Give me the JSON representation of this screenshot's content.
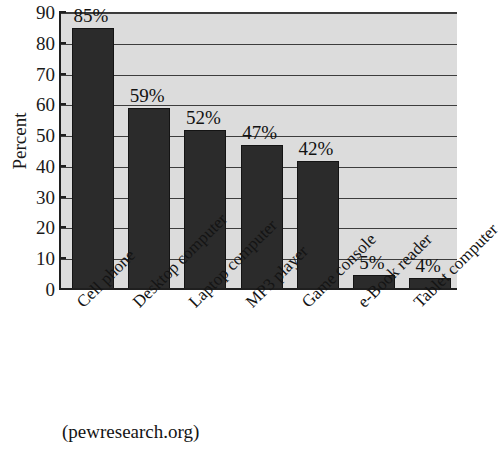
{
  "chart_data": {
    "type": "bar",
    "title": "",
    "xlabel": "",
    "ylabel": "Percent",
    "ylim": [
      0,
      90
    ],
    "ytick_step": 10,
    "yticks": [
      0,
      10,
      20,
      30,
      40,
      50,
      60,
      70,
      80,
      90
    ],
    "ytick_labels": [
      "0",
      "10",
      "20",
      "30",
      "40",
      "50",
      "60",
      "70",
      "80",
      "90"
    ],
    "grid": true,
    "grid_axis": "y",
    "legend": false,
    "legend_position": "none",
    "categories": [
      "Cell phone",
      "Desktop computer",
      "Laptop computer",
      "MP3 player",
      "Game console",
      "e-Book reader",
      "Tablet computer"
    ],
    "values": [
      85,
      59,
      52,
      47,
      42,
      5,
      4
    ],
    "data_labels": [
      "85%",
      "59%",
      "52%",
      "47%",
      "42%",
      "5%",
      "4%"
    ],
    "bar_color": "#2b2b2b",
    "plot_background": "#dcdcdc",
    "figure_background": "#ffffff",
    "gridline_color": "#3d3d3d",
    "axis_color": "#1f1f1f"
  },
  "source": {
    "note": "(pewresearch.org)"
  }
}
